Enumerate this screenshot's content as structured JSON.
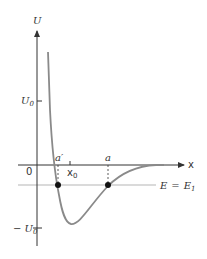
{
  "diagram": {
    "axes": {
      "y_label": "U",
      "x_label": "x",
      "origin_label": "0"
    },
    "ticks": {
      "u0": "U",
      "u0_sub": "0",
      "neg_u0": "− U",
      "neg_u0_sub": "0",
      "x0": "x",
      "x0_sub": "0"
    },
    "points": {
      "a_prime": "a′",
      "a": "a"
    },
    "energy_line": {
      "label_e": "E",
      "label_eq": "=",
      "label_e1": "E",
      "label_e1_sub": "1"
    },
    "colors": {
      "axis": "#333333",
      "curve": "#8a8a8a",
      "energy_line": "#b0b0b0",
      "dots": "#111111"
    }
  }
}
